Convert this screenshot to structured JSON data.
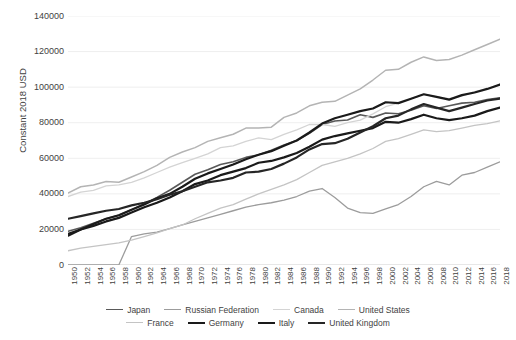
{
  "title": "",
  "axes": {
    "ylabel": "Constant 2018 USD",
    "yticks": [
      "0",
      "20000",
      "40000",
      "60000",
      "80000",
      "100000",
      "120000",
      "140000"
    ],
    "xticks": [
      "1950",
      "1952",
      "1954",
      "1956",
      "1958",
      "1960",
      "1962",
      "1964",
      "1966",
      "1968",
      "1970",
      "1972",
      "1974",
      "1976",
      "1978",
      "1980",
      "1982",
      "1984",
      "1986",
      "1988",
      "1990",
      "1992",
      "1994",
      "1996",
      "1998",
      "2000",
      "2002",
      "2004",
      "2006",
      "2008",
      "2010",
      "2012",
      "2014",
      "2016",
      "2018"
    ]
  },
  "legend": {
    "rows": [
      [
        {
          "label": "Japan",
          "color": "#595959",
          "width": 1.6
        },
        {
          "label": "Russian Federation",
          "color": "#9c9c9c",
          "width": 1.3
        },
        {
          "label": "Canada",
          "color": "#d4d4d4",
          "width": 1.3
        },
        {
          "label": "United States",
          "color": "#b4b4b4",
          "width": 1.5
        }
      ],
      [
        {
          "label": "France",
          "color": "#c4c4c4",
          "width": 1.3
        },
        {
          "label": "Germany",
          "color": "#1a1a1a",
          "width": 2.2
        },
        {
          "label": "Italy",
          "color": "#1a1a1a",
          "width": 2.2
        },
        {
          "label": "United Kingdom",
          "color": "#262626",
          "width": 2.2
        }
      ]
    ]
  },
  "chart_data": {
    "type": "line",
    "title": "",
    "xlabel": "",
    "ylabel": "Constant 2018 USD",
    "ylim": [
      0,
      140000
    ],
    "xlim": [
      1950,
      2018
    ],
    "grid": true,
    "legend_position": "bottom",
    "x": [
      1950,
      1952,
      1954,
      1956,
      1958,
      1960,
      1962,
      1964,
      1966,
      1968,
      1970,
      1972,
      1974,
      1976,
      1978,
      1980,
      1982,
      1984,
      1986,
      1988,
      1990,
      1992,
      1994,
      1996,
      1998,
      2000,
      2002,
      2004,
      2006,
      2008,
      2010,
      2012,
      2014,
      2016,
      2018
    ],
    "series": [
      {
        "name": "Japan",
        "color": "#595959",
        "width": 1.6,
        "values": [
          19000,
          21000,
          23500,
          26000,
          28000,
          31000,
          34500,
          38000,
          42000,
          46500,
          51000,
          53500,
          56500,
          58000,
          60500,
          62000,
          64500,
          67500,
          70000,
          74000,
          79000,
          81000,
          81500,
          84500,
          83000,
          85500,
          85000,
          87000,
          89500,
          88000,
          89500,
          91000,
          91500,
          93000,
          94000
        ]
      },
      {
        "name": "Russian Federation",
        "color": "#9c9c9c",
        "width": 1.3,
        "values": [
          0,
          0,
          0,
          0,
          0,
          16000,
          17500,
          18500,
          20500,
          22500,
          24500,
          26500,
          28500,
          30500,
          32500,
          34000,
          35000,
          36500,
          38500,
          41500,
          43000,
          38000,
          32000,
          29500,
          29000,
          31500,
          34000,
          38500,
          44000,
          47000,
          45000,
          50500,
          52000,
          55000,
          58000
        ]
      },
      {
        "name": "Canada",
        "color": "#d4d4d4",
        "width": 1.3,
        "values": [
          38500,
          41000,
          42000,
          44500,
          45000,
          46500,
          49000,
          52000,
          55000,
          57500,
          60000,
          62500,
          66000,
          67000,
          69500,
          71500,
          70500,
          73500,
          76000,
          79000,
          79000,
          78000,
          80000,
          81500,
          85000,
          89000,
          91000,
          93500,
          96000,
          94500,
          93500,
          95000,
          97500,
          99000,
          101500
        ]
      },
      {
        "name": "United States",
        "color": "#b4b4b4",
        "width": 1.5,
        "values": [
          40500,
          44000,
          45000,
          47000,
          46500,
          49500,
          52500,
          56000,
          60500,
          63500,
          66000,
          69500,
          71500,
          73500,
          77000,
          77000,
          77500,
          83000,
          85500,
          89500,
          91500,
          92000,
          95500,
          99000,
          104000,
          109500,
          110000,
          114000,
          117000,
          115000,
          115500,
          118000,
          121000,
          124000,
          127000
        ]
      },
      {
        "name": "France",
        "color": "#c4c4c4",
        "width": 1.3,
        "values": [
          8000,
          9500,
          10500,
          11500,
          12500,
          14000,
          16000,
          18000,
          20500,
          22500,
          26000,
          29000,
          32000,
          34000,
          37000,
          40000,
          42500,
          45000,
          48000,
          52000,
          56000,
          58000,
          60000,
          62500,
          65500,
          69500,
          71000,
          73500,
          76000,
          75000,
          75500,
          77000,
          78500,
          79500,
          81000
        ]
      },
      {
        "name": "Germany",
        "color": "#1a1a1a",
        "width": 2.2,
        "values": [
          16500,
          20000,
          23000,
          26000,
          28000,
          31000,
          34000,
          37500,
          40000,
          44000,
          48500,
          51500,
          54000,
          56500,
          59500,
          62000,
          64000,
          67000,
          70000,
          74500,
          79500,
          82500,
          84500,
          86500,
          88000,
          91500,
          91000,
          93500,
          96000,
          94500,
          93000,
          95500,
          97000,
          99000,
          101500
        ]
      },
      {
        "name": "Italy",
        "color": "#1a1a1a",
        "width": 2.2,
        "values": [
          17500,
          20000,
          22000,
          24500,
          26500,
          29500,
          32500,
          35000,
          38000,
          41500,
          45500,
          47500,
          50500,
          52500,
          54500,
          57500,
          58500,
          60500,
          63000,
          66500,
          70500,
          72500,
          74000,
          75500,
          77000,
          80500,
          80000,
          82000,
          84500,
          82500,
          81500,
          82500,
          84000,
          86500,
          88500
        ]
      },
      {
        "name": "United Kingdom",
        "color": "#262626",
        "width": 2.2,
        "values": [
          26000,
          27500,
          29000,
          30500,
          31500,
          33500,
          35000,
          37000,
          39500,
          41500,
          44000,
          46500,
          47500,
          49000,
          52000,
          52500,
          54000,
          57000,
          60500,
          65000,
          68000,
          68500,
          71000,
          74500,
          78000,
          82500,
          84000,
          87500,
          90500,
          88500,
          86500,
          88500,
          90500,
          92500,
          93500
        ]
      }
    ]
  }
}
